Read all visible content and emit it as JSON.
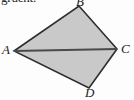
{
  "figure": {
    "caption_fragment": "gruent.",
    "background_color": "#fdfdfd",
    "fill_color": "#c9c9c9",
    "stroke_color": "#2d2d2d",
    "diagonal_color": "#4a4a4a",
    "shape_name": "quadrilateral-ABCD",
    "vertices": [
      {
        "id": "A",
        "label": "A",
        "x": 14,
        "y": 51
      },
      {
        "id": "B",
        "label": "B",
        "x": 79,
        "y": 6
      },
      {
        "id": "C",
        "label": "C",
        "x": 117,
        "y": 49
      },
      {
        "id": "D",
        "label": "D",
        "x": 89,
        "y": 88
      }
    ],
    "edges": [
      {
        "id": "AB",
        "from": "A",
        "to": "B"
      },
      {
        "id": "BC",
        "from": "B",
        "to": "C"
      },
      {
        "id": "CD",
        "from": "C",
        "to": "D"
      },
      {
        "id": "DA",
        "from": "D",
        "to": "A"
      }
    ],
    "diagonal": {
      "id": "AC",
      "from": "A",
      "to": "C"
    },
    "polygon_points": "14,51 79,6 117,49 89,88",
    "diagonal_x1": 14,
    "diagonal_y1": 51,
    "diagonal_x2": 117,
    "diagonal_y2": 49
  }
}
